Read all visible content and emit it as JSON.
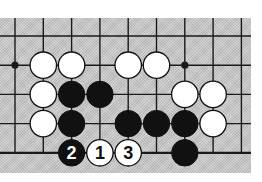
{
  "diagram": {
    "board": {
      "columns": 9,
      "rows": 5,
      "open_top": true,
      "open_bottom": false,
      "background": "#c9c9c9",
      "line_color": "#1a1a1a"
    },
    "star_points": [
      {
        "col": 0,
        "row": 1
      },
      {
        "col": 6,
        "row": 1
      }
    ],
    "stones": [
      {
        "col": 1,
        "row": 1,
        "color": "white",
        "label": ""
      },
      {
        "col": 2,
        "row": 1,
        "color": "white",
        "label": ""
      },
      {
        "col": 4,
        "row": 1,
        "color": "white",
        "label": ""
      },
      {
        "col": 5,
        "row": 1,
        "color": "white",
        "label": ""
      },
      {
        "col": 1,
        "row": 2,
        "color": "white",
        "label": ""
      },
      {
        "col": 2,
        "row": 2,
        "color": "black",
        "label": ""
      },
      {
        "col": 3,
        "row": 2,
        "color": "black",
        "label": ""
      },
      {
        "col": 6,
        "row": 2,
        "color": "white",
        "label": ""
      },
      {
        "col": 7,
        "row": 2,
        "color": "white",
        "label": ""
      },
      {
        "col": 1,
        "row": 3,
        "color": "white",
        "label": ""
      },
      {
        "col": 2,
        "row": 3,
        "color": "black",
        "label": ""
      },
      {
        "col": 4,
        "row": 3,
        "color": "black",
        "label": ""
      },
      {
        "col": 5,
        "row": 3,
        "color": "black",
        "label": ""
      },
      {
        "col": 6,
        "row": 3,
        "color": "black",
        "label": ""
      },
      {
        "col": 7,
        "row": 3,
        "color": "white",
        "label": ""
      },
      {
        "col": 2,
        "row": 4,
        "color": "black",
        "label": "2"
      },
      {
        "col": 3,
        "row": 4,
        "color": "white",
        "label": "1"
      },
      {
        "col": 4,
        "row": 4,
        "color": "white",
        "label": "3"
      },
      {
        "col": 6,
        "row": 4,
        "color": "black",
        "label": ""
      }
    ]
  }
}
